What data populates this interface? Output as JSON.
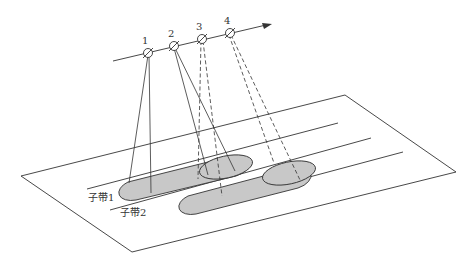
{
  "diagram": {
    "type": "scan-geometry",
    "satellites": [
      {
        "label": "1",
        "x": 148,
        "y": 53
      },
      {
        "label": "2",
        "x": 174,
        "y": 46
      },
      {
        "label": "3",
        "x": 202,
        "y": 39
      },
      {
        "label": "4",
        "x": 230,
        "y": 33
      }
    ],
    "subswaths": [
      {
        "label": "子带1"
      },
      {
        "label": "子带2"
      }
    ],
    "colors": {
      "line": "#333333",
      "footprint_fill": "#c8c8c8",
      "background": "#ffffff"
    }
  }
}
